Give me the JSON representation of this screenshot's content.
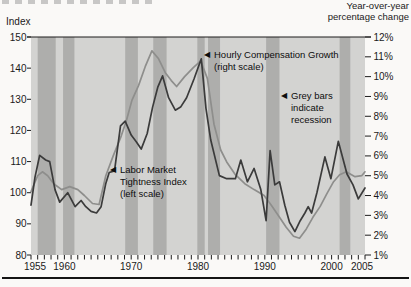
{
  "header": {
    "left_axis_title": "Index",
    "right_axis_title_line1": "Year-over-year",
    "right_axis_title_line2": "percentage change"
  },
  "chart_data": {
    "type": "line",
    "title": "",
    "grid": false,
    "legend_position": "none",
    "x_axis": {
      "min": 1955,
      "max": 2005,
      "labeled_ticks": [
        1955,
        1960,
        1970,
        1980,
        1990,
        2000,
        2005
      ],
      "minor_tick_step": 1
    },
    "left_axis": {
      "label": "Index",
      "min": 80,
      "max": 150,
      "ticks": [
        150,
        140,
        130,
        120,
        110,
        100,
        90,
        80
      ]
    },
    "right_axis": {
      "label": "Year-over-year percentage change",
      "min": 1,
      "max": 12,
      "ticks": [
        12,
        11,
        10,
        9,
        8,
        7,
        6,
        5,
        4,
        3,
        2,
        1
      ],
      "tick_suffix": "%"
    },
    "colors": {
      "plot_bg": "#d3d3d1",
      "recession_bar": "#aeaeac",
      "tightness_line": "#3b3b3b",
      "compensation_line": "#8e8e8c",
      "axis": "#1c1c1c"
    },
    "recession_bars": [
      [
        1956.0,
        1958.7
      ],
      [
        1959.8,
        1961.5
      ],
      [
        1969.1,
        1971.0
      ],
      [
        1973.3,
        1975.3
      ],
      [
        1979.9,
        1981.0
      ],
      [
        1981.5,
        1983.3
      ],
      [
        1990.2,
        1992.2
      ],
      [
        2001.2,
        2002.8
      ]
    ],
    "series": [
      {
        "name": "Hourly Compensation Growth",
        "scale": "right",
        "color_key": "compensation_line",
        "points": [
          [
            1955.0,
            4.2
          ],
          [
            1956.0,
            5.0
          ],
          [
            1956.7,
            5.2
          ],
          [
            1957.5,
            5.0
          ],
          [
            1958.4,
            4.6
          ],
          [
            1959.6,
            4.3
          ],
          [
            1960.8,
            4.45
          ],
          [
            1962.0,
            4.3
          ],
          [
            1963.0,
            4.0
          ],
          [
            1964.2,
            3.6
          ],
          [
            1965.2,
            3.55
          ],
          [
            1966.2,
            5.0
          ],
          [
            1967.3,
            6.0
          ],
          [
            1968.5,
            7.0
          ],
          [
            1969.3,
            7.8
          ],
          [
            1970.1,
            8.8
          ],
          [
            1971.1,
            9.55
          ],
          [
            1972.1,
            10.5
          ],
          [
            1973.1,
            11.3
          ],
          [
            1974.1,
            10.9
          ],
          [
            1975.1,
            10.2
          ],
          [
            1976.0,
            9.8
          ],
          [
            1976.8,
            9.5
          ],
          [
            1978.0,
            10.0
          ],
          [
            1979.3,
            10.45
          ],
          [
            1980.4,
            10.8
          ],
          [
            1981.4,
            9.9
          ],
          [
            1982.4,
            7.6
          ],
          [
            1983.4,
            6.3
          ],
          [
            1984.3,
            5.7
          ],
          [
            1985.6,
            5.05
          ],
          [
            1987.0,
            4.6
          ],
          [
            1988.4,
            4.3
          ],
          [
            1989.9,
            4.0
          ],
          [
            1991.0,
            3.5
          ],
          [
            1992.2,
            2.9
          ],
          [
            1993.2,
            2.4
          ],
          [
            1994.3,
            1.95
          ],
          [
            1995.2,
            1.85
          ],
          [
            1996.2,
            2.3
          ],
          [
            1997.2,
            2.9
          ],
          [
            1998.3,
            3.45
          ],
          [
            1999.3,
            4.1
          ],
          [
            2000.3,
            4.7
          ],
          [
            2001.2,
            5.05
          ],
          [
            2002.2,
            5.2
          ],
          [
            2003.5,
            4.95
          ],
          [
            2004.5,
            5.0
          ],
          [
            2005.0,
            5.2
          ]
        ]
      },
      {
        "name": "Labor Market Tightness Index",
        "scale": "left",
        "color_key": "tightness_line",
        "points": [
          [
            1955.0,
            96
          ],
          [
            1955.6,
            105
          ],
          [
            1956.3,
            112
          ],
          [
            1957.2,
            110.5
          ],
          [
            1957.8,
            110
          ],
          [
            1958.6,
            101
          ],
          [
            1959.3,
            97
          ],
          [
            1960.5,
            100
          ],
          [
            1961.6,
            95.5
          ],
          [
            1962.5,
            97.5
          ],
          [
            1963.2,
            95.5
          ],
          [
            1964.0,
            94
          ],
          [
            1964.8,
            93.5
          ],
          [
            1965.5,
            95.5
          ],
          [
            1966.2,
            103
          ],
          [
            1966.7,
            106.5
          ],
          [
            1967.5,
            107
          ],
          [
            1968.4,
            121.5
          ],
          [
            1969.1,
            123
          ],
          [
            1970.0,
            118.5
          ],
          [
            1970.7,
            116.5
          ],
          [
            1971.5,
            114
          ],
          [
            1972.4,
            119
          ],
          [
            1973.2,
            127.5
          ],
          [
            1974.0,
            134
          ],
          [
            1974.7,
            137.5
          ],
          [
            1975.6,
            130.5
          ],
          [
            1976.6,
            126.5
          ],
          [
            1977.4,
            127.5
          ],
          [
            1978.3,
            130.5
          ],
          [
            1979.4,
            136.5
          ],
          [
            1980.5,
            143
          ],
          [
            1981.2,
            127
          ],
          [
            1981.9,
            117
          ],
          [
            1983.2,
            105.5
          ],
          [
            1984.3,
            104.5
          ],
          [
            1985.6,
            104.5
          ],
          [
            1986.4,
            110.5
          ],
          [
            1987.4,
            103.5
          ],
          [
            1988.4,
            107.8
          ],
          [
            1989.4,
            101
          ],
          [
            1990.2,
            91
          ],
          [
            1990.8,
            113.5
          ],
          [
            1991.5,
            102.5
          ],
          [
            1992.2,
            103.5
          ],
          [
            1993.0,
            96
          ],
          [
            1993.7,
            90.5
          ],
          [
            1994.5,
            87.5
          ],
          [
            1995.3,
            91
          ],
          [
            1996.0,
            93.5
          ],
          [
            1996.5,
            95.5
          ],
          [
            1997.0,
            93.5
          ],
          [
            1997.8,
            100
          ],
          [
            1999.0,
            111.5
          ],
          [
            1999.9,
            104.5
          ],
          [
            2001.0,
            116.5
          ],
          [
            2002.3,
            106
          ],
          [
            2003.2,
            102.5
          ],
          [
            2004.0,
            98
          ],
          [
            2005.0,
            101.5
          ]
        ]
      }
    ],
    "annotations": [
      {
        "id": "hourly-compensation-growth-label",
        "arrow": "◀",
        "x": 204,
        "y": 49,
        "lines": [
          "Hourly Compensation Growth",
          "(right scale)"
        ]
      },
      {
        "id": "grey-bars-label",
        "arrow": "◀",
        "x": 281,
        "y": 90,
        "lines": [
          "Grey bars",
          "indicate",
          "recession"
        ]
      },
      {
        "id": "labor-market-tightness-label",
        "arrow": "◀",
        "x": 110,
        "y": 164,
        "lines": [
          "Labor Market",
          "Tightness Index",
          "(left scale)"
        ]
      }
    ]
  }
}
